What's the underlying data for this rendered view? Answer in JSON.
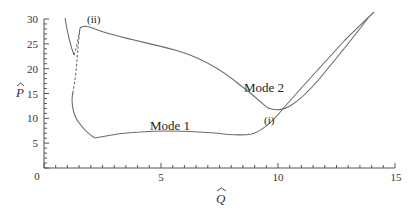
{
  "chart_data": {
    "type": "line",
    "title": "",
    "xlabel": "Q̂",
    "ylabel": "P̂",
    "xlim": [
      0,
      15
    ],
    "ylim": [
      0,
      30
    ],
    "xticks": [
      0,
      5,
      10,
      15
    ],
    "yticks": [
      5,
      10,
      15,
      20,
      25,
      30
    ],
    "x_tick_labels": [
      "0",
      "5",
      "10",
      "15"
    ],
    "y_tick_labels": [
      "5",
      "10",
      "15",
      "20",
      "25",
      "30"
    ],
    "grid": false,
    "legend": null,
    "series": [
      {
        "name": "Mode 1",
        "style": "solid",
        "points": [
          [
            1.2,
            17.5
          ],
          [
            1.25,
            13
          ],
          [
            1.5,
            9.5
          ],
          [
            2.0,
            7.0
          ],
          [
            2.2,
            6.0
          ],
          [
            3.0,
            6.5
          ],
          [
            4.5,
            7.1
          ],
          [
            6.0,
            6.8
          ],
          [
            7.5,
            6.5
          ],
          [
            8.2,
            7.5
          ],
          [
            9.0,
            10.5
          ],
          [
            10.0,
            14
          ],
          [
            11.0,
            20
          ],
          [
            12.0,
            26.5
          ],
          [
            12.5,
            29.5
          ]
        ]
      },
      {
        "name": "Mode 2",
        "style": "solid",
        "points": [
          [
            1.5,
            28.2
          ],
          [
            2.0,
            27.5
          ],
          [
            3.0,
            26.0
          ],
          [
            5.0,
            24.5
          ],
          [
            7.0,
            21.5
          ],
          [
            8.0,
            18.0
          ],
          [
            9.0,
            14.5
          ],
          [
            9.5,
            12.5
          ],
          [
            10.0,
            12.3
          ],
          [
            10.5,
            13.0
          ],
          [
            11.5,
            17.5
          ],
          [
            12.5,
            23.5
          ],
          [
            13.5,
            29.5
          ]
        ]
      },
      {
        "name": "Mode 1 upper-left branch",
        "style": "solid",
        "points": [
          [
            0.9,
            29.5
          ],
          [
            1.0,
            27.5
          ],
          [
            1.15,
            25.5
          ],
          [
            1.3,
            24.2
          ]
        ]
      },
      {
        "name": "Unstable connection (dashed)",
        "style": "dashed",
        "points": [
          [
            1.3,
            24.2
          ],
          [
            1.4,
            25.5
          ],
          [
            1.5,
            28.2
          ],
          [
            1.45,
            25
          ],
          [
            1.4,
            22
          ],
          [
            1.3,
            20
          ],
          [
            1.2,
            17.5
          ]
        ]
      }
    ],
    "annotations": [
      {
        "text": "Mode 1",
        "x": 4.5,
        "y": 8.5
      },
      {
        "text": "Mode 2",
        "x": 8.0,
        "y": 22.5
      },
      {
        "text": "(i)",
        "x": 9.9,
        "y": 9.5
      },
      {
        "text": "(ii)",
        "x": 2.3,
        "y": 29.2
      }
    ]
  },
  "labels": {
    "x_axis": "Q",
    "y_axis": "P",
    "mode1": "Mode 1",
    "mode2": "Mode 2",
    "point_i": "(i)",
    "point_ii": "(ii)",
    "tick_x_0": "0",
    "tick_x_5": "5",
    "tick_x_10": "10",
    "tick_x_15": "15",
    "tick_y_5": "5",
    "tick_y_10": "10",
    "tick_y_15": "15",
    "tick_y_20": "20",
    "tick_y_25": "25",
    "tick_y_30": "30"
  }
}
